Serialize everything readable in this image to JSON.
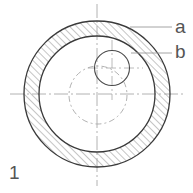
{
  "figure": {
    "number_label": "1",
    "callouts": [
      {
        "id": "a",
        "label": "a",
        "target": "pipe-wall-cross-section"
      },
      {
        "id": "b",
        "label": "b",
        "target": "small-offset-circle"
      }
    ]
  },
  "geometry": {
    "center_lines": {
      "main_horizontal": {
        "x1": 10,
        "y1": 94,
        "x2": 184,
        "y2": 94
      },
      "main_vertical": {
        "x1": 97,
        "y1": 4,
        "x2": 97,
        "y2": 186
      },
      "small_horizontal": {
        "x1": 88,
        "y1": 68,
        "x2": 143,
        "y2": 68
      },
      "small_vertical": {
        "x1": 112,
        "y1": 40,
        "x2": 112,
        "y2": 100
      }
    },
    "outer_circle": {
      "cx": 97,
      "cy": 94,
      "r": 73
    },
    "inner_circle": {
      "cx": 97,
      "cy": 94,
      "r": 58
    },
    "dashed_circle": {
      "cx": 98,
      "cy": 95,
      "r": 29
    },
    "small_circle": {
      "cx": 112,
      "cy": 68,
      "r": 17.5
    },
    "leader_a": {
      "x1": 130,
      "y1": 27,
      "x2": 172,
      "y2": 27
    },
    "leader_b": {
      "x1": 131,
      "y1": 53,
      "x2": 172,
      "y2": 53
    }
  },
  "colors": {
    "stroke_main": "#3a3a3a",
    "stroke_light": "#9a9a9a",
    "hatch": "#8c8c8c",
    "label": "#555555",
    "background": "#ffffff"
  }
}
